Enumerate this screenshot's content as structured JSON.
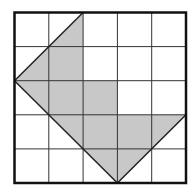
{
  "diagram": {
    "type": "grid-figure",
    "grid": {
      "cols": 5,
      "rows": 5
    },
    "shaded_polygon": [
      [
        2,
        0
      ],
      [
        2,
        2
      ],
      [
        3,
        2
      ],
      [
        3,
        3
      ],
      [
        5,
        3
      ],
      [
        3,
        5
      ],
      [
        0,
        2
      ]
    ],
    "colors": {
      "background": "#ffffff",
      "grid_line": "#333333",
      "border": "#111111",
      "fill": "#c8c8c8",
      "outline": "#222222"
    }
  }
}
